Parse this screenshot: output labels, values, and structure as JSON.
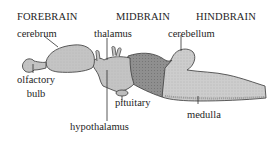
{
  "diagram": {
    "regions": [
      {
        "id": "forebrain",
        "label": "FOREBRAIN"
      },
      {
        "id": "midbrain",
        "label": "MIDBRAIN"
      },
      {
        "id": "hindbrain",
        "label": "HINDBRAIN"
      }
    ],
    "parts": {
      "cerebrum": "cerebrum",
      "thalamus": "thalamus",
      "cerebellum": "cerebellum",
      "olfactory_bulb_line1": "olfactory",
      "olfactory_bulb_line2": "bulb",
      "pituitary": "pituitary",
      "hypothalamus": "hypothalamus",
      "medulla": "medulla"
    },
    "colors": {
      "forebrain_fill": "#c4c4c4",
      "midbrain_fill": "#8f8f8f",
      "hindbrain_fill": "#cdcdcd",
      "outline": "#4a4a4a",
      "text": "#1e1e1e",
      "background": "#ffffff"
    }
  }
}
